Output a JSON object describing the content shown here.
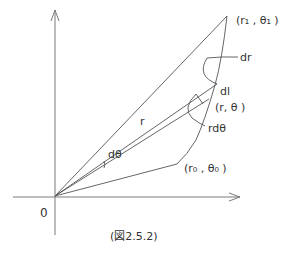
{
  "figure": {
    "caption": "(図2.5.2)",
    "labels": {
      "origin": "0",
      "point_end": "(r₁ , θ₁ )",
      "point_start": "(r₀ , θ₀ )",
      "point_mid": "(r, θ )",
      "radius": "r",
      "d_theta": "dθ",
      "dr": "dr",
      "dl": "dl",
      "r_d_theta": "rdθ"
    },
    "colors": {
      "line": "#555555",
      "axis": "#777777",
      "text": "#333333"
    }
  }
}
